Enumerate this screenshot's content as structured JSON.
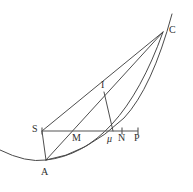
{
  "figure": {
    "type": "geometry-diagram",
    "background_color": "#ffffff",
    "stroke_color": "#3a3a3a",
    "label_color": "#2e2e2e",
    "points": [
      {
        "id": "C",
        "label": "C",
        "x": 163,
        "y": 32,
        "label_x": 169,
        "label_y": 25,
        "italic": false
      },
      {
        "id": "I",
        "label": "I",
        "x": 104,
        "y": 92,
        "label_x": 101,
        "label_y": 80,
        "italic": false
      },
      {
        "id": "S",
        "label": "S",
        "x": 42,
        "y": 131,
        "label_x": 32,
        "label_y": 124,
        "italic": false
      },
      {
        "id": "M",
        "label": "M",
        "x": 77,
        "y": 131,
        "label_x": 72,
        "label_y": 133,
        "italic": false
      },
      {
        "id": "mu",
        "label": "μ",
        "x": 113,
        "y": 131,
        "label_x": 107,
        "label_y": 134,
        "italic": true
      },
      {
        "id": "N",
        "label": "N",
        "x": 122,
        "y": 131,
        "label_x": 118,
        "label_y": 133,
        "italic": false
      },
      {
        "id": "P",
        "label": "P",
        "x": 138,
        "y": 131,
        "label_x": 134,
        "label_y": 133,
        "italic": false
      },
      {
        "id": "A",
        "label": "A",
        "x": 46,
        "y": 160,
        "label_x": 41,
        "label_y": 167,
        "italic": false
      }
    ],
    "segments": [
      {
        "id": "seg-S-C",
        "from": "S",
        "to": "C"
      },
      {
        "id": "seg-S-A",
        "from": "S",
        "to": "A"
      },
      {
        "id": "seg-A-C",
        "from": "A",
        "to": "C"
      },
      {
        "id": "seg-I-mu",
        "from": "I",
        "to": "mu"
      },
      {
        "id": "seg-S-P",
        "from": "S",
        "to": "P"
      }
    ],
    "ticks": [
      {
        "id": "tick-S",
        "x": 42
      },
      {
        "id": "tick-N",
        "x": 122
      },
      {
        "id": "tick-P",
        "x": 138
      }
    ],
    "curves": [
      {
        "id": "parabola-A-C",
        "description": "parabola through A rising past C",
        "path": "M 0 150 Q 26 163 46 160 Q 86 154 124 118 Q 152 88 172 14"
      },
      {
        "id": "arc-A-C",
        "description": "arc from A up to C",
        "path": "M 46 160 Q 120 152 163 32"
      }
    ]
  }
}
